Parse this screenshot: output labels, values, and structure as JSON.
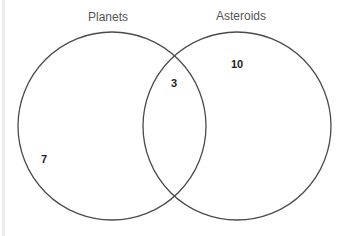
{
  "diagram": {
    "type": "venn",
    "sets": [
      {
        "label": "Planets",
        "only_count": "7"
      },
      {
        "label": "Asteroids",
        "only_count": "10"
      }
    ],
    "intersection_count": "3",
    "colors": {
      "stroke": "#4a4a4a",
      "background": "#ffffff"
    }
  }
}
